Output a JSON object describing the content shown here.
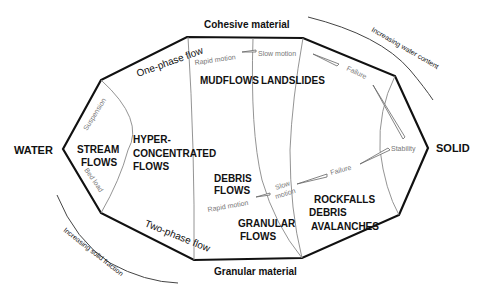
{
  "diagram": {
    "axis_labels": {
      "left": "WATER",
      "right": "SOLID",
      "top": "Cohesive material",
      "bottom": "Granular material"
    },
    "edge_labels": {
      "one_phase": "One-phase flow",
      "two_phase": "Two-phase flow"
    },
    "trend_labels": {
      "water_content": "Increasing water content",
      "solid_fraction": "Increasing solid fraction"
    },
    "regions": {
      "stream": [
        "STREAM",
        "FLOWS"
      ],
      "hyper": [
        "HYPER-",
        "CONCENTRATED",
        "FLOWS"
      ],
      "mudflows": "MUDFLOWS",
      "landslides": "LANDSLIDES",
      "debris_flows": [
        "DEBRIS",
        "FLOWS"
      ],
      "granular_flows": [
        "GRANULAR",
        "FLOWS"
      ],
      "rockfalls": [
        "ROCKFALLS",
        "DEBRIS",
        "AVALANCHES"
      ]
    },
    "transport_modes": {
      "suspension": "Suspension",
      "bed_load": "Bed load"
    },
    "motion_labels": {
      "rapid_top": "Rapid motion",
      "slow_top": "Slow motion",
      "failure_top": "Failure",
      "stability": "Stability",
      "failure_bottom": "Failure",
      "slow_bottom": [
        "Slow",
        "motion"
      ],
      "rapid_bottom": "Rapid motion"
    },
    "colors": {
      "outline": "#111111",
      "divider": "#888888",
      "thin_text": "#777777"
    }
  }
}
